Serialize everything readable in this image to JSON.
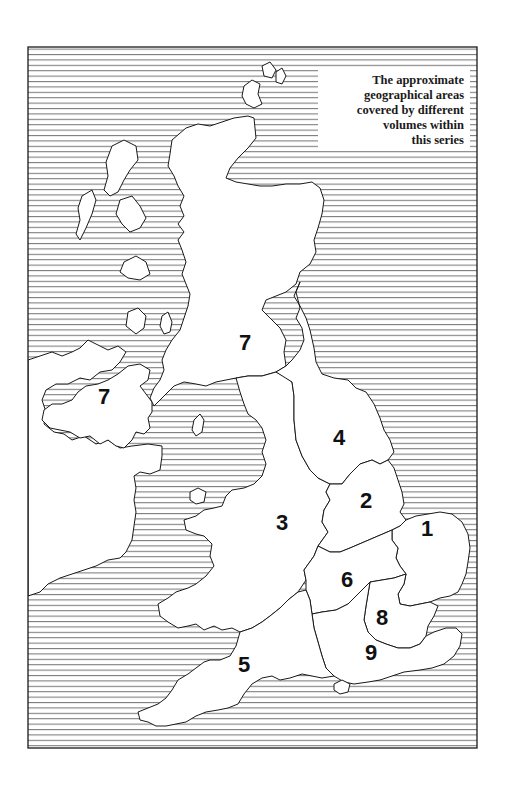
{
  "legend": {
    "lines": [
      "The approximate",
      "geographical areas",
      "covered by different",
      "volumes within",
      "this series"
    ]
  },
  "colors": {
    "sea_hatch": "#555555",
    "land": "#ffffff",
    "border": "#1a1a1a",
    "background": "#ffffff"
  },
  "regions": [
    {
      "id": "scotland",
      "label": "7",
      "x": 246,
      "y": 350
    },
    {
      "id": "northern-ireland",
      "label": "7",
      "x": 105,
      "y": 405
    },
    {
      "id": "north-england-east",
      "label": "4",
      "x": 340,
      "y": 446
    },
    {
      "id": "midlands-east",
      "label": "2",
      "x": 367,
      "y": 508
    },
    {
      "id": "west-wales-midlands",
      "label": "3",
      "x": 283,
      "y": 530
    },
    {
      "id": "east-anglia",
      "label": "1",
      "x": 428,
      "y": 536
    },
    {
      "id": "south-midlands",
      "label": "6",
      "x": 348,
      "y": 587
    },
    {
      "id": "london-thames",
      "label": "8",
      "x": 383,
      "y": 625
    },
    {
      "id": "south-east",
      "label": "9",
      "x": 372,
      "y": 660
    },
    {
      "id": "south-west",
      "label": "5",
      "x": 245,
      "y": 672
    }
  ]
}
